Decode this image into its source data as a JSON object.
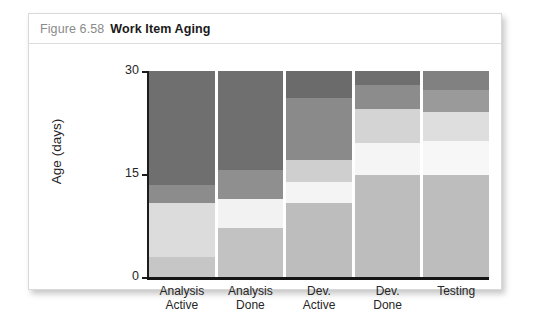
{
  "figure": {
    "number": "Figure 6.58",
    "title": "Work Item Aging"
  },
  "chart_data": {
    "type": "bar",
    "title": "Work Item Aging",
    "xlabel": "",
    "ylabel": "Age (days)",
    "ylim": [
      0,
      30
    ],
    "yticks": [
      0,
      15,
      30
    ],
    "ytick_labels": [
      "0",
      "15",
      "30"
    ],
    "grid": false,
    "legend": false,
    "note": "Work item aging chart. Each column is a workflow stage; stacked grayscale bands represent aging distribution bands of work items from 0 to 30 days.",
    "categories": [
      "Analysis\nActive",
      "Analysis\nDone",
      "Dev.\nActive",
      "Dev.\nDone",
      "Testing"
    ],
    "category_lines": [
      [
        "Analysis",
        "Active"
      ],
      [
        "Analysis",
        "Done"
      ],
      [
        "Dev.",
        "Active"
      ],
      [
        "Dev.",
        "Done"
      ],
      [
        "Testing",
        ""
      ]
    ],
    "columns": [
      {
        "name": "Analysis Active",
        "bands": [
          {
            "from": 13.4,
            "to": 30.0,
            "color": "#6f6f6f"
          },
          {
            "from": 10.8,
            "to": 13.4,
            "color": "#8c8c8c"
          },
          {
            "from": 2.9,
            "to": 10.8,
            "color": "#dcdcdc"
          },
          {
            "from": 0.0,
            "to": 2.9,
            "color": "#c6c6c6"
          }
        ]
      },
      {
        "name": "Analysis Done",
        "bands": [
          {
            "from": 15.6,
            "to": 30.0,
            "color": "#6f6f6f"
          },
          {
            "from": 11.3,
            "to": 15.6,
            "color": "#8f8f8f"
          },
          {
            "from": 7.1,
            "to": 11.3,
            "color": "#f2f2f2"
          },
          {
            "from": 0.0,
            "to": 7.1,
            "color": "#c2c2c2"
          }
        ]
      },
      {
        "name": "Dev. Active",
        "bands": [
          {
            "from": 26.0,
            "to": 30.0,
            "color": "#6b6b6b"
          },
          {
            "from": 17.0,
            "to": 26.0,
            "color": "#8a8a8a"
          },
          {
            "from": 13.8,
            "to": 17.0,
            "color": "#cfcfcf"
          },
          {
            "from": 10.8,
            "to": 13.8,
            "color": "#f4f4f4"
          },
          {
            "from": 0.0,
            "to": 10.8,
            "color": "#bdbdbd"
          }
        ]
      },
      {
        "name": "Dev. Done",
        "bands": [
          {
            "from": 28.0,
            "to": 30.0,
            "color": "#6e6e6e"
          },
          {
            "from": 24.5,
            "to": 28.0,
            "color": "#8c8c8c"
          },
          {
            "from": 19.5,
            "to": 24.5,
            "color": "#d4d4d4"
          },
          {
            "from": 14.8,
            "to": 19.5,
            "color": "#f5f5f5"
          },
          {
            "from": 0.0,
            "to": 14.8,
            "color": "#bdbdbd"
          }
        ]
      },
      {
        "name": "Testing",
        "bands": [
          {
            "from": 27.2,
            "to": 30.0,
            "color": "#818181"
          },
          {
            "from": 24.0,
            "to": 27.2,
            "color": "#9a9a9a"
          },
          {
            "from": 19.8,
            "to": 24.0,
            "color": "#dedede"
          },
          {
            "from": 14.8,
            "to": 19.8,
            "color": "#f7f7f7"
          },
          {
            "from": 0.0,
            "to": 14.8,
            "color": "#bdbdbd"
          }
        ]
      }
    ]
  }
}
